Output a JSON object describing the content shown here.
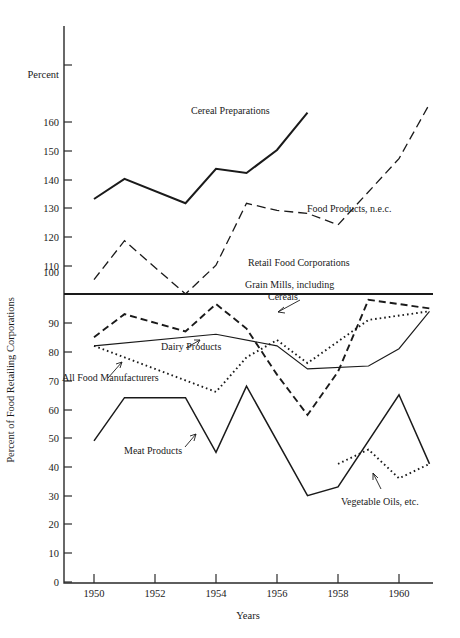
{
  "chart_data": {
    "type": "line",
    "title": "",
    "xlabel": "Years",
    "ylabel": "Percent of Food Retailing Corporations",
    "y_unit_label": "Percent",
    "xlim": [
      1949.5,
      1961.6
    ],
    "ylim": [
      0,
      170
    ],
    "grid": false,
    "legend_position": "inline-annotations",
    "x_ticks": [
      1950,
      1952,
      1954,
      1956,
      1958,
      1960
    ],
    "x_tick_labels": [
      "1950",
      "1952",
      "1954",
      "1956",
      "1958",
      "1960"
    ],
    "y_ticks": [
      0,
      10,
      20,
      30,
      40,
      50,
      60,
      70,
      80,
      90,
      100,
      110,
      120,
      130,
      140,
      150,
      160
    ],
    "y_tick_labels": [
      "0",
      "10",
      "20",
      "30",
      "40",
      "50",
      "60",
      "70",
      "80",
      "90",
      "100",
      "110",
      "120",
      "130",
      "140",
      "150",
      "160"
    ],
    "series": [
      {
        "name": "Cereal Preparations",
        "style": "solid-heavy",
        "x": [
          1950,
          1951,
          1953,
          1954,
          1955,
          1956,
          1957
        ],
        "values": [
          133,
          140,
          131.5,
          143.5,
          142,
          150,
          163
        ]
      },
      {
        "name": "Food Products, n.e.c.",
        "style": "long-dash",
        "x": [
          1950,
          1951,
          1953,
          1954,
          1955,
          1956,
          1957,
          1958,
          1960,
          1961
        ],
        "values": [
          105,
          118.5,
          100,
          110,
          131.5,
          129,
          128,
          124,
          147,
          166
        ]
      },
      {
        "name": "Retail Food Corporations",
        "style": "solid-baseline",
        "x": [
          1950,
          1961
        ],
        "values": [
          100,
          100
        ]
      },
      {
        "name": "Grain Mills, including Cereals",
        "style": "dash",
        "x": [
          1950,
          1951,
          1953,
          1954,
          1955,
          1956,
          1957,
          1958,
          1959,
          1961
        ],
        "values": [
          85,
          93,
          87,
          96.5,
          88,
          72,
          58,
          73,
          98,
          95
        ]
      },
      {
        "name": "Dairy Products",
        "style": "solid-thin",
        "x": [
          1950,
          1954,
          1956,
          1957,
          1959,
          1960,
          1961
        ],
        "values": [
          82,
          86,
          82,
          74,
          75,
          81,
          94
        ]
      },
      {
        "name": "All Food Manufacturers",
        "style": "dotted",
        "x": [
          1950,
          1954,
          1955,
          1956,
          1957,
          1959,
          1961
        ],
        "values": [
          82,
          66,
          78,
          84,
          76,
          91,
          94
        ]
      },
      {
        "name": "Meat Products",
        "style": "solid",
        "x": [
          1950,
          1951,
          1953,
          1954,
          1955,
          1957,
          1958,
          1960,
          1961
        ],
        "values": [
          49,
          64,
          64,
          45,
          68,
          30,
          33,
          65,
          41
        ]
      },
      {
        "name": "Vegetable Oils, etc.",
        "style": "dotted",
        "x": [
          1958,
          1959,
          1960,
          1961
        ],
        "values": [
          41,
          46,
          36,
          41
        ]
      }
    ],
    "annotations": [
      {
        "text": "Cereal Preparations",
        "x": 1954.0,
        "y": 152,
        "has_leader": false
      },
      {
        "text": "Food Products, n.e.c.",
        "x": 1955.8,
        "y": 122,
        "has_leader": false
      },
      {
        "text": "Retail Food Corporations",
        "x": 1955.0,
        "y": 102.5,
        "has_leader": false
      },
      {
        "text": "Grain Mills, including",
        "x": 1955.6,
        "y": 96,
        "has_leader": true
      },
      {
        "text": "Cereals",
        "x": 1956.5,
        "y": 92,
        "has_leader": false
      },
      {
        "text": "Dairy Products",
        "x": 1952.8,
        "y": 78,
        "has_leader": true
      },
      {
        "text": "All Food Manufacturers",
        "x": 1949.6,
        "y": 70,
        "has_leader": true
      },
      {
        "text": "Meat Products",
        "x": 1951.0,
        "y": 54,
        "has_leader": true
      },
      {
        "text": "Vegetable Oils, etc.",
        "x": 1958.5,
        "y": 30,
        "has_leader": true
      }
    ]
  },
  "labels": {
    "percent": "Percent",
    "y_axis_title": "Percent of Food Retailing Corporations",
    "x_axis_title": "Years",
    "tick_1950": "1950",
    "tick_1952": "1952",
    "tick_1954": "1954",
    "tick_1956": "1956",
    "tick_1958": "1958",
    "tick_1960": "1960",
    "y_0": "0",
    "y_10": "10",
    "y_20": "20",
    "y_30": "30",
    "y_40": "40",
    "y_50": "50",
    "y_60": "60",
    "y_70": "70",
    "y_80": "80",
    "y_90": "90",
    "y_100": "100",
    "y_110": "110",
    "y_120": "120",
    "y_130": "130",
    "y_140": "140",
    "y_150": "150",
    "y_160": "160",
    "s_cereal": "Cereal Preparations",
    "s_food_nec": "Food Products, n.e.c.",
    "s_retail": "Retail Food Corporations",
    "s_grain_1": "Grain Mills, including",
    "s_grain_2": "Cereals",
    "s_dairy": "Dairy Products",
    "s_allfood": "All Food Manufacturers",
    "s_meat": "Meat Products",
    "s_vegoil": "Vegetable Oils, etc."
  },
  "colors": {
    "ink": "#1a1a1a",
    "axis": "#2a2a2a",
    "background": "#ffffff"
  }
}
